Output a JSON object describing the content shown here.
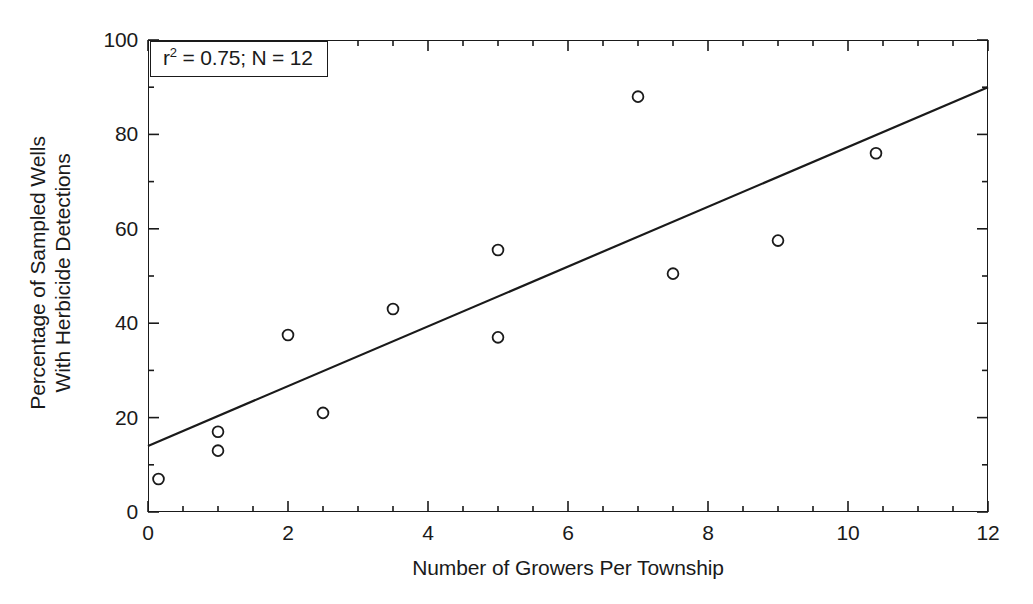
{
  "chart_data": {
    "type": "scatter",
    "title": "",
    "xlabel": "Number of Growers Per Township",
    "ylabel_lines": [
      "Percentage of Sampled Wells",
      "With Herbicide Detections"
    ],
    "ylabel": "Percentage of Sampled Wells With Herbicide Detections",
    "xlim": [
      0,
      12
    ],
    "ylim": [
      0,
      100
    ],
    "x_major_ticks": [
      0,
      2,
      4,
      6,
      8,
      10,
      12
    ],
    "x_tick_labels": [
      "0",
      "2",
      "4",
      "6",
      "8",
      "10",
      "12"
    ],
    "x_minor_step": 0.5,
    "y_major_ticks": [
      0,
      20,
      40,
      60,
      80,
      100
    ],
    "y_tick_labels": [
      "0",
      "20",
      "40",
      "60",
      "80",
      "100"
    ],
    "y_minor_step": 10,
    "grid": false,
    "legend": "none",
    "marker": "open-circle",
    "marker_color": "#1a1a1a",
    "line_color": "#1a1a1a",
    "points": [
      {
        "x": 0.15,
        "y": 7
      },
      {
        "x": 1.0,
        "y": 17
      },
      {
        "x": 1.0,
        "y": 13
      },
      {
        "x": 2.0,
        "y": 37.5
      },
      {
        "x": 2.5,
        "y": 21
      },
      {
        "x": 3.5,
        "y": 43
      },
      {
        "x": 5.0,
        "y": 55.5
      },
      {
        "x": 5.0,
        "y": 37
      },
      {
        "x": 7.0,
        "y": 88
      },
      {
        "x": 7.5,
        "y": 50.5
      },
      {
        "x": 9.0,
        "y": 57.5
      },
      {
        "x": 10.4,
        "y": 76
      }
    ],
    "trendline": {
      "type": "linear-regression",
      "x_start": 0,
      "y_start": 14,
      "x_end": 12,
      "y_end": 90,
      "slope": 6.33,
      "intercept": 14
    },
    "annotation": {
      "r_squared_prefix": "r",
      "r_squared_exponent": "2",
      "r_squared_text": " = 0.75; N = 12",
      "full_text": "r2 = 0.75; N = 12",
      "r_squared_value": 0.75,
      "n_value": 12
    }
  }
}
